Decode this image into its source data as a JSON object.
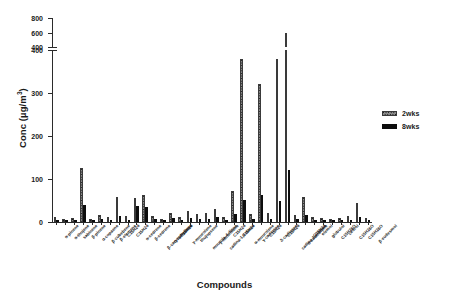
{
  "chart_data": {
    "type": "bar",
    "title": "",
    "xlabel": "Compounds",
    "ylabel": "Conc (µg/m³)",
    "grid": false,
    "legend_position": "right",
    "y_axis_broken": true,
    "y_lower_segment": [
      0,
      400
    ],
    "y_upper_segment": [
      400,
      800
    ],
    "y_lower_ticks": [
      0,
      100,
      200,
      300,
      400
    ],
    "y_upper_ticks": [
      400,
      600,
      800
    ],
    "categories": [
      "α-pinene",
      "α-thujene",
      "sabinene",
      "β-pinene",
      "α-copaene",
      "β-cubebene",
      "β-elemene",
      "C15H24",
      "C15H24",
      "α-cedrene",
      "β-cedrene",
      "β-caryophyllene",
      "α-humulene",
      "C15H24",
      "γ-muurolene",
      "thujopsene",
      "muurola-4-diene",
      "γ-muurolene",
      "cadina-1,4-diene",
      "C15H24",
      "C15H24",
      "α-muurolene",
      "γ-cadinene",
      "C15H24",
      "δ-cadinene",
      "C15H24",
      "cadina-1,4-diene",
      "α-calacorene",
      "C15H24",
      "elemol",
      "globulol",
      "C15H26O",
      "cedrol",
      "C15H26O",
      "C15H26O",
      "β-eudesmol"
    ],
    "series": [
      {
        "name": "2wks",
        "values": [
          12,
          6,
          10,
          125,
          8,
          16,
          12,
          58,
          14,
          55,
          62,
          14,
          8,
          22,
          12,
          26,
          18,
          20,
          30,
          12,
          72,
          380,
          18,
          320,
          20,
          380,
          600,
          16,
          58,
          12,
          10,
          8,
          10,
          14,
          45,
          10
        ]
      },
      {
        "name": "8wks",
        "values": [
          4,
          2,
          5,
          40,
          3,
          6,
          4,
          14,
          5,
          38,
          34,
          6,
          3,
          9,
          5,
          10,
          7,
          8,
          12,
          5,
          18,
          52,
          7,
          62,
          8,
          48,
          122,
          6,
          16,
          4,
          3,
          2,
          3,
          5,
          12,
          3
        ]
      }
    ]
  },
  "legend": {
    "entries": [
      {
        "label": "2wks",
        "style": "stippled"
      },
      {
        "label": "8wks",
        "style": "solid-black"
      }
    ]
  },
  "colors": {
    "series_2wks": "#8a8a8a",
    "series_8wks": "#0d0d0d",
    "axis": "#2b2b2b",
    "text": "#1a1a1a",
    "background": "#ffffff"
  }
}
